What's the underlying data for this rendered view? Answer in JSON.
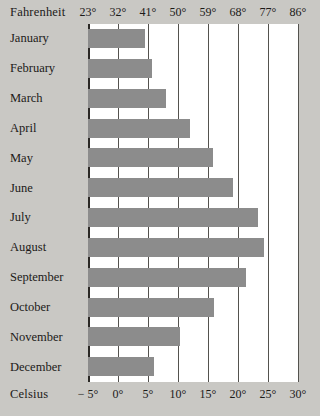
{
  "chart_data": {
    "type": "bar",
    "title": "",
    "orientation": "horizontal",
    "grid": true,
    "legend": false,
    "xlabel_primary": "Fahrenheit",
    "xlabel_secondary": "Celsius",
    "ylabel": "",
    "categories": [
      "January",
      "February",
      "March",
      "April",
      "May",
      "June",
      "July",
      "August",
      "September",
      "October",
      "November",
      "December"
    ],
    "values": [
      4.5,
      5.7,
      8.0,
      12.0,
      15.8,
      19.2,
      23.3,
      24.3,
      21.3,
      16.0,
      10.3,
      6.0
    ],
    "unit": "°C",
    "values_fahrenheit": [
      40.1,
      42.3,
      46.4,
      53.6,
      60.4,
      66.6,
      73.9,
      75.7,
      70.3,
      60.8,
      50.5,
      42.8
    ],
    "xlim_celsius": [
      -5,
      30
    ],
    "xlim_fahrenheit": [
      23,
      86
    ],
    "ticks_celsius": [
      "− 5°",
      "0°",
      "5°",
      "10°",
      "15°",
      "20°",
      "25°",
      "30°"
    ],
    "ticks_celsius_values": [
      -5,
      0,
      5,
      10,
      15,
      20,
      25,
      30
    ],
    "ticks_fahrenheit": [
      "23°",
      "32°",
      "41°",
      "50°",
      "59°",
      "68°",
      "77°",
      "86°"
    ],
    "ticks_fahrenheit_values": [
      23,
      32,
      41,
      50,
      59,
      68,
      77,
      86
    ],
    "colors": {
      "bar": "#8c8c8c",
      "background": "#c9c8c4",
      "plot_background": "#ffffff",
      "gridline": "#54524e",
      "axis": "#2a2825",
      "text": "#1c1a18"
    }
  }
}
